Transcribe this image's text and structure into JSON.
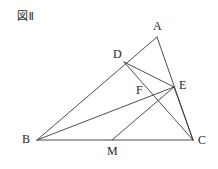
{
  "figure": {
    "title": "図Ⅱ",
    "caption_id": "figure-2",
    "stroke_color": "#3a3a3a",
    "label_color": "#262626",
    "background_color": "#ffffff",
    "canvas": {
      "width": 218,
      "height": 169
    },
    "points": [
      {
        "id": "A",
        "label": "A",
        "x": 157,
        "y": 37,
        "label_x": 153,
        "label_y": 20
      },
      {
        "id": "B",
        "label": "B",
        "x": 37,
        "y": 140,
        "label_x": 22,
        "label_y": 133
      },
      {
        "id": "C",
        "label": "C",
        "x": 193,
        "y": 140,
        "label_x": 198,
        "label_y": 134
      },
      {
        "id": "D",
        "label": "D",
        "x": 124,
        "y": 62,
        "label_x": 113,
        "label_y": 48
      },
      {
        "id": "E",
        "label": "E",
        "x": 174,
        "y": 87,
        "label_x": 179,
        "label_y": 79
      },
      {
        "id": "F",
        "label": "F",
        "x": 148,
        "y": 96,
        "label_x": 136,
        "label_y": 84
      },
      {
        "id": "M",
        "label": "M",
        "x": 112,
        "y": 140,
        "label_x": 107,
        "label_y": 145
      }
    ],
    "segments": [
      {
        "id": "AB",
        "from": "A",
        "to": "B"
      },
      {
        "id": "AC",
        "from": "A",
        "to": "C"
      },
      {
        "id": "BC",
        "from": "B",
        "to": "C"
      },
      {
        "id": "DE",
        "from": "D",
        "to": "E"
      },
      {
        "id": "DC",
        "from": "D",
        "to": "C"
      },
      {
        "id": "BE",
        "from": "B",
        "to": "E"
      },
      {
        "id": "EC",
        "from": "E",
        "to": "C"
      },
      {
        "id": "ME",
        "from": "M",
        "to": "E"
      }
    ]
  }
}
